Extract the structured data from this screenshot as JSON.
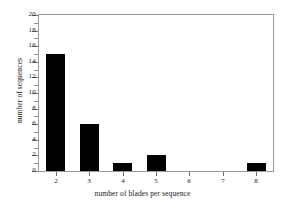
{
  "chart_data": {
    "type": "bar",
    "title": "",
    "xlabel": "number of blades per sequence",
    "ylabel": "number of sequences",
    "categories": [
      "2",
      "3",
      "4",
      "5",
      "6",
      "7",
      "8"
    ],
    "values": [
      15,
      6,
      1,
      2,
      0,
      0,
      1
    ],
    "series": [
      {
        "name": "number of sequences",
        "values": [
          15,
          6,
          1,
          2,
          0,
          0,
          1
        ]
      }
    ],
    "ylim": [
      0,
      20
    ],
    "ytick_labels": [
      "0",
      "2",
      "4",
      "6",
      "8",
      "10",
      "12",
      "14",
      "16",
      "18",
      "20"
    ],
    "ytick_values": [
      0,
      2,
      4,
      6,
      8,
      10,
      12,
      14,
      16,
      18,
      20
    ],
    "yminor_values": [
      1,
      3,
      5,
      7,
      9,
      11,
      13,
      15,
      17,
      19
    ],
    "xtick_labels": [
      "2",
      "3",
      "4",
      "5",
      "6",
      "7",
      "8"
    ],
    "grid": false,
    "legend": false,
    "legend_position": "none",
    "bar_color": "#000000",
    "frame_color": "#9a9a9a",
    "text_color": "#1a1a1a",
    "background": "#ffffff"
  }
}
